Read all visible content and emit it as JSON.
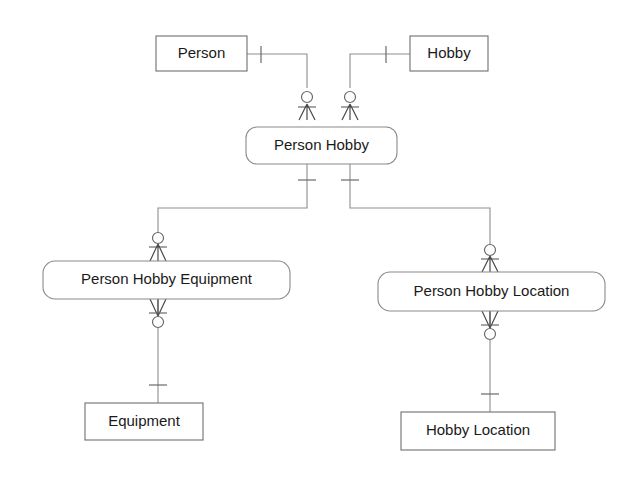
{
  "diagram": {
    "type": "entity-relationship-diagram",
    "notation": "crow's-foot",
    "background_color": "#ffffff",
    "line_color": "#8d8d8d",
    "text_color": "#1a1a1a",
    "entities": [
      {
        "id": "person",
        "label": "Person",
        "shape": "rectangle",
        "kind": "strong-entity",
        "x": 156,
        "y": 36,
        "w": 91,
        "h": 35
      },
      {
        "id": "hobby",
        "label": "Hobby",
        "shape": "rectangle",
        "kind": "strong-entity",
        "x": 410,
        "y": 36,
        "w": 78,
        "h": 35
      },
      {
        "id": "person-hobby",
        "label": "Person Hobby",
        "shape": "rounded-rectangle",
        "kind": "associative-entity",
        "x": 246,
        "y": 127,
        "w": 151,
        "h": 37
      },
      {
        "id": "person-hobby-equipment",
        "label": "Person Hobby Equipment",
        "shape": "rounded-rectangle",
        "kind": "associative-entity",
        "x": 43,
        "y": 261,
        "w": 247,
        "h": 38
      },
      {
        "id": "person-hobby-location",
        "label": "Person Hobby Location",
        "shape": "rounded-rectangle",
        "kind": "associative-entity",
        "x": 378,
        "y": 272,
        "w": 227,
        "h": 39
      },
      {
        "id": "equipment",
        "label": "Equipment",
        "shape": "rectangle",
        "kind": "strong-entity",
        "x": 85,
        "y": 403,
        "w": 118,
        "h": 37
      },
      {
        "id": "hobby-location",
        "label": "Hobby Location",
        "shape": "rectangle",
        "kind": "strong-entity",
        "x": 401,
        "y": 412,
        "w": 154,
        "h": 38
      }
    ],
    "relationships": [
      {
        "id": "person-to-person-hobby",
        "from": "person",
        "to": "person-hobby",
        "from_cardinality": "exactly-one",
        "to_cardinality": "zero-or-many"
      },
      {
        "id": "hobby-to-person-hobby",
        "from": "hobby",
        "to": "person-hobby",
        "from_cardinality": "exactly-one",
        "to_cardinality": "zero-or-many"
      },
      {
        "id": "person-hobby-to-person-hobby-equipment",
        "from": "person-hobby",
        "to": "person-hobby-equipment",
        "from_cardinality": "exactly-one",
        "to_cardinality": "zero-or-many"
      },
      {
        "id": "person-hobby-to-person-hobby-location",
        "from": "person-hobby",
        "to": "person-hobby-location",
        "from_cardinality": "exactly-one",
        "to_cardinality": "zero-or-many"
      },
      {
        "id": "equipment-to-person-hobby-equipment",
        "from": "equipment",
        "to": "person-hobby-equipment",
        "from_cardinality": "exactly-one",
        "to_cardinality": "zero-or-many"
      },
      {
        "id": "hobby-location-to-person-hobby-location",
        "from": "hobby-location",
        "to": "person-hobby-location",
        "from_cardinality": "exactly-one",
        "to_cardinality": "zero-or-many"
      }
    ]
  }
}
